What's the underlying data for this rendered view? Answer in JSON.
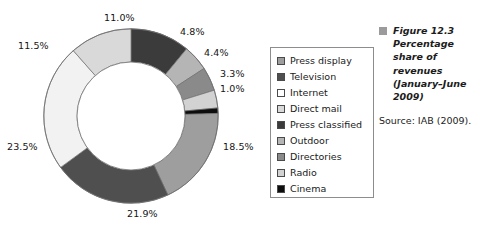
{
  "chart_data": {
    "type": "pie",
    "variant": "donut",
    "title": "Percentage share of revenues (January–June 2009)",
    "xlabel": "",
    "ylabel": "",
    "units": "percent",
    "start_angle_deg": 0,
    "direction": "clockwise",
    "inner_radius_ratio": 0.62,
    "legend_position": "right",
    "grid": false,
    "categories": [
      "Press classified",
      "Outdoor",
      "Directories",
      "Radio",
      "Cinema",
      "Press display",
      "Television",
      "Internet",
      "Direct mail"
    ],
    "values": [
      11.0,
      4.8,
      4.4,
      3.3,
      1.0,
      18.5,
      21.9,
      23.5,
      11.5
    ],
    "data_labels": [
      "11.0%",
      "4.8%",
      "4.4%",
      "3.3%",
      "1.0%",
      "18.5%",
      "21.9%",
      "23.5%",
      "11.5%"
    ],
    "colors": [
      "#3b3b3b",
      "#b5b5b5",
      "#8a8a8a",
      "#d2d2d2",
      "#0d0d0d",
      "#9e9e9e",
      "#4f4f4f",
      "#f2f2f2",
      "#d9d9d9"
    ],
    "slices": [
      {
        "label": "Press classified",
        "value": 11.0,
        "data_label": "11.0%",
        "color": "#3b3b3b"
      },
      {
        "label": "Outdoor",
        "value": 4.8,
        "data_label": "4.8%",
        "color": "#b5b5b5"
      },
      {
        "label": "Directories",
        "value": 4.4,
        "data_label": "4.4%",
        "color": "#8a8a8a"
      },
      {
        "label": "Radio",
        "value": 3.3,
        "data_label": "3.3%",
        "color": "#d2d2d2"
      },
      {
        "label": "Cinema",
        "value": 1.0,
        "data_label": "1.0%",
        "color": "#0d0d0d"
      },
      {
        "label": "Press display",
        "value": 18.5,
        "data_label": "18.5%",
        "color": "#9e9e9e"
      },
      {
        "label": "Television",
        "value": 21.9,
        "data_label": "21.9%",
        "color": "#4f4f4f"
      },
      {
        "label": "Internet",
        "value": 23.5,
        "data_label": "23.5%",
        "color": "#f2f2f2"
      },
      {
        "label": "Direct mail",
        "value": 11.5,
        "data_label": "11.5%",
        "color": "#d9d9d9"
      }
    ]
  },
  "labels": {
    "l1": "11.0%",
    "l2": "4.8%",
    "l3": "4.4%",
    "l4": "3.3%",
    "l5": "1.0%",
    "l6": "18.5%",
    "l7": "21.9%",
    "l8": "23.5%",
    "l9": "11.5%"
  },
  "legend": {
    "items": [
      {
        "label": "Press display",
        "color": "#9e9e9e"
      },
      {
        "label": "Television",
        "color": "#4f4f4f"
      },
      {
        "label": "Internet",
        "color": "#ffffff"
      },
      {
        "label": "Direct mail",
        "color": "#d9d9d9"
      },
      {
        "label": "Press classified",
        "color": "#3b3b3b"
      },
      {
        "label": "Outdoor",
        "color": "#b5b5b5"
      },
      {
        "label": "Directories",
        "color": "#8a8a8a"
      },
      {
        "label": "Radio",
        "color": "#d2d2d2"
      },
      {
        "label": "Cinema",
        "color": "#0d0d0d"
      }
    ]
  },
  "caption": {
    "marker_color": "#9b9b9b",
    "figure_number": "Figure 12.3",
    "line2": "Percentage",
    "line3": "share of",
    "line4": "revenues",
    "line5": "(January–June",
    "line6": "2009)",
    "source": "Source: IAB (2009)."
  }
}
